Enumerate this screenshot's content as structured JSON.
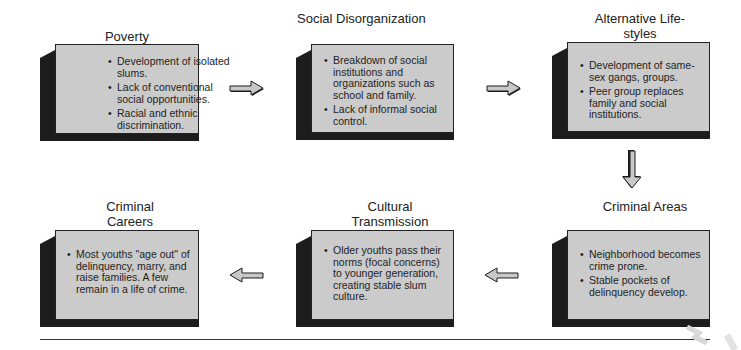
{
  "diagram": {
    "type": "flow",
    "direction": "clockwise: Poverty -> Social Disorganization -> Alternative Life-styles -> Criminal Areas -> Cultural Transmission -> Criminal Careers",
    "colors": {
      "box_face": "#cbcbcb",
      "box_shadow": "#1c1c1c",
      "arrow_fill": "#c8c8c8",
      "arrow_outline": "#1c1c1c"
    },
    "stages": [
      {
        "title": "Poverty",
        "bullets": [
          "Development of isolated slums.",
          "Lack of conventional social opportunities.",
          "Racial and ethnic discrimination."
        ]
      },
      {
        "title": "Social Disorganization",
        "bullets": [
          "Breakdown of social institutions and organizations such as school and family.",
          "Lack of informal social control."
        ]
      },
      {
        "title": "Alternative Life-styles",
        "bullets": [
          "Development of same-sex gangs, groups.",
          "Peer group replaces family and social institutions."
        ]
      },
      {
        "title": "Criminal Areas",
        "bullets": [
          "Neighborhood becomes crime prone.",
          "Stable pockets of delinquency develop."
        ]
      },
      {
        "title": "Cultural Transmission",
        "bullets": [
          "Older youths pass their norms (focal concerns) to younger generation, creating stable slum culture."
        ]
      },
      {
        "title": "Criminal Careers",
        "bullets": [
          "Most youths \"age out\" of delinquency, marry, and raise families. A few remain in a life of crime."
        ]
      }
    ],
    "arrows": [
      {
        "from": "Poverty",
        "to": "Social Disorganization",
        "direction": "right"
      },
      {
        "from": "Social Disorganization",
        "to": "Alternative Life-styles",
        "direction": "right"
      },
      {
        "from": "Alternative Life-styles",
        "to": "Criminal Areas",
        "direction": "down"
      },
      {
        "from": "Criminal Areas",
        "to": "Cultural Transmission",
        "direction": "left"
      },
      {
        "from": "Cultural Transmission",
        "to": "Criminal Careers",
        "direction": "left"
      }
    ]
  }
}
